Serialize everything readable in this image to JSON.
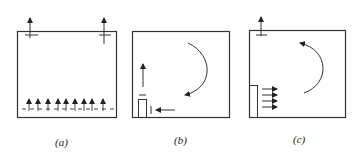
{
  "panels": [
    {
      "id": "a",
      "label": "(a)",
      "description": "Two top exhaust outlets, floor-level distributed upward supply"
    },
    {
      "id": "b",
      "label": "(b)",
      "description": "Clockwise circulation with corner inlet and horizontal arrow"
    },
    {
      "id": "c",
      "label": "(c)",
      "description": "Counter-clockwise circulation with wall displacement supply"
    }
  ],
  "colors": {
    "stroke": "#333333",
    "background": "#ffffff"
  }
}
